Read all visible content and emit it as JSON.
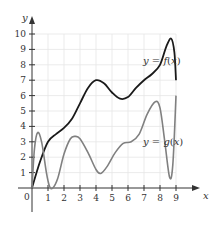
{
  "chart_data": {
    "type": "line",
    "title": "",
    "xlabel": "x",
    "ylabel": "y",
    "xlim": [
      0,
      9
    ],
    "ylim": [
      0,
      10
    ],
    "grid": true,
    "x_ticks": [
      "0",
      "1",
      "2",
      "3",
      "4",
      "5",
      "6",
      "7",
      "8",
      "9"
    ],
    "y_ticks": [
      "1",
      "2",
      "3",
      "4",
      "5",
      "6",
      "7",
      "8",
      "9",
      "10"
    ],
    "series": [
      {
        "name": "y = f(x)",
        "color": "#1a1a1a",
        "points": [
          [
            0,
            0
          ],
          [
            0.5,
            1.7
          ],
          [
            1,
            3.0
          ],
          [
            1.5,
            3.5
          ],
          [
            2,
            3.9
          ],
          [
            2.5,
            4.5
          ],
          [
            3,
            5.5
          ],
          [
            3.5,
            6.5
          ],
          [
            4,
            7.0
          ],
          [
            4.5,
            6.8
          ],
          [
            5,
            6.2
          ],
          [
            5.5,
            5.8
          ],
          [
            6,
            5.9
          ],
          [
            6.5,
            6.5
          ],
          [
            7,
            7.0
          ],
          [
            7.5,
            7.4
          ],
          [
            8,
            8.0
          ],
          [
            8.4,
            9.2
          ],
          [
            8.7,
            9.7
          ],
          [
            8.9,
            8.8
          ],
          [
            9,
            7.0
          ]
        ]
      },
      {
        "name": "y = g(x)",
        "color": "#808080",
        "points": [
          [
            0,
            0
          ],
          [
            0.15,
            2.5
          ],
          [
            0.35,
            3.6
          ],
          [
            0.6,
            3.0
          ],
          [
            0.9,
            1.0
          ],
          [
            1.1,
            0.1
          ],
          [
            1.3,
            0
          ],
          [
            1.6,
            0.6
          ],
          [
            2,
            2.2
          ],
          [
            2.4,
            3.2
          ],
          [
            2.7,
            3.35
          ],
          [
            3,
            3.2
          ],
          [
            3.5,
            2.3
          ],
          [
            4,
            1.2
          ],
          [
            4.3,
            0.95
          ],
          [
            4.7,
            1.4
          ],
          [
            5.2,
            2.3
          ],
          [
            5.7,
            2.9
          ],
          [
            6.2,
            3.0
          ],
          [
            6.7,
            3.5
          ],
          [
            7.2,
            4.8
          ],
          [
            7.7,
            5.6
          ],
          [
            8,
            5.2
          ],
          [
            8.3,
            3.0
          ],
          [
            8.6,
            0.7
          ],
          [
            8.8,
            1.5
          ],
          [
            9,
            6.0
          ]
        ]
      }
    ],
    "annotations": [
      {
        "text": "y = f(x)",
        "x": 6.9,
        "y": 8.2
      },
      {
        "text": "y = g(x)",
        "x": 6.9,
        "y": 3.0
      }
    ]
  },
  "labels": {
    "x_axis": "x",
    "y_axis": "y",
    "origin": "0",
    "f_prefix": "y = ",
    "f_name": "f(x)",
    "g_prefix": "y = ",
    "g_name": "g(x)"
  }
}
